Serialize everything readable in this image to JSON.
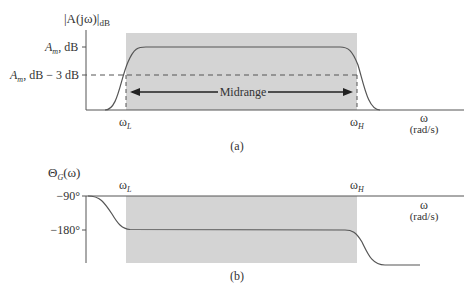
{
  "top": {
    "ylabel": "|A(jω)|",
    "ylabel_sub": "dB",
    "am_label": "A",
    "am_sub": "m",
    "am_suffix": ", dB",
    "am3_suffix": ", dB − 3 dB",
    "midrange": "Midrange",
    "wl": "ω",
    "wl_sub": "L",
    "wh": "ω",
    "wh_sub": "H",
    "w": "ω",
    "w_unit": "(rad/s)",
    "caption": "(a)"
  },
  "bottom": {
    "ylabel": "Θ",
    "ylabel_sub": "G",
    "ylabel_arg": "(ω)",
    "tick_90": "−90°",
    "tick_180": "−180°",
    "wl": "ω",
    "wl_sub": "L",
    "wh": "ω",
    "wh_sub": "H",
    "w": "ω",
    "w_unit": "(rad/s)",
    "caption": "(b)"
  },
  "colors": {
    "shade": "#d4d4d4",
    "line": "#555555"
  }
}
